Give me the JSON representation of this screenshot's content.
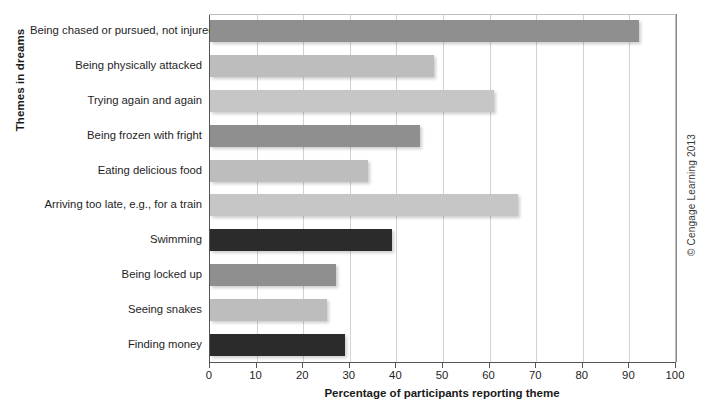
{
  "chart_data": {
    "type": "bar",
    "orientation": "horizontal",
    "title": "",
    "xlabel": "Percentage of participants reporting theme",
    "ylabel": "Themes in dreams",
    "xlim": [
      0,
      100
    ],
    "xticks": [
      0,
      10,
      20,
      30,
      40,
      50,
      60,
      70,
      80,
      90,
      100
    ],
    "grid": "vertical",
    "legend": "none",
    "categories": [
      "Being chased or pursued, not injured",
      "Being physically attacked",
      "Trying again and again",
      "Being frozen with fright",
      "Eating delicious food",
      "Arriving too late, e.g., for a train",
      "Swimming",
      "Being locked up",
      "Seeing snakes",
      "Finding money"
    ],
    "values": [
      92,
      48,
      61,
      45,
      34,
      66,
      39,
      27,
      25,
      29
    ],
    "bar_colors": [
      "#8f8f8f",
      "#bdbdbd",
      "#c6c6c6",
      "#8f8f8f",
      "#bdbdbd",
      "#c6c6c6",
      "#2b2b2b",
      "#8f8f8f",
      "#bdbdbd",
      "#2b2b2b"
    ]
  },
  "annotations": {
    "copyright": "© Cengage Learning 2013"
  },
  "colors": {
    "axis": "#555555",
    "gridline": "#d2d2d2",
    "text": "#1e1e1e",
    "background": "#ffffff"
  }
}
